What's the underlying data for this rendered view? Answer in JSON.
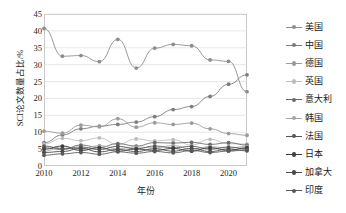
{
  "chart_data": {
    "type": "line",
    "title": "",
    "xlabel": "年份",
    "ylabel": "SCI论文数量占比/%",
    "x": [
      2010,
      2011,
      2012,
      2013,
      2014,
      2015,
      2016,
      2017,
      2018,
      2019,
      2020,
      2021
    ],
    "xticks": [
      "2010",
      "2012",
      "2014",
      "2016",
      "2018",
      "2020"
    ],
    "yticks": [
      "0",
      "5",
      "10",
      "15",
      "20",
      "25",
      "30",
      "35",
      "40",
      "45"
    ],
    "ylim": [
      0,
      45
    ],
    "xlim": [
      2010,
      2021
    ],
    "grid": "horizontal",
    "legend_position": "right",
    "series": [
      {
        "name": "美国",
        "color": "#8d8d8d",
        "values": [
          40.7,
          32.5,
          32.7,
          30.9,
          37.5,
          29.0,
          34.9,
          36.0,
          35.6,
          31.4,
          31.0,
          22.0
        ]
      },
      {
        "name": "中国",
        "color": "#7d7d7d",
        "values": [
          6.9,
          9.2,
          11.0,
          11.8,
          12.3,
          13.0,
          14.6,
          16.7,
          17.6,
          20.6,
          24.2,
          27.0
        ]
      },
      {
        "name": "德国",
        "color": "#9b9b9b",
        "values": [
          10.3,
          9.7,
          12.1,
          11.6,
          14.0,
          11.5,
          12.8,
          12.3,
          12.7,
          11.0,
          9.6,
          9.1
        ]
      },
      {
        "name": "英国",
        "color": "#bdbdbd",
        "values": [
          6.5,
          8.2,
          7.5,
          8.3,
          6.4,
          8.0,
          7.4,
          7.8,
          6.2,
          7.9,
          6.6,
          6.5
        ]
      },
      {
        "name": "意大利",
        "color": "#6a6a6a",
        "values": [
          5.4,
          4.9,
          6.2,
          5.5,
          6.6,
          5.9,
          6.9,
          6.8,
          7.0,
          6.4,
          6.9,
          6.2
        ]
      },
      {
        "name": "韩国",
        "color": "#a6a6a6",
        "values": [
          4.4,
          5.7,
          5.0,
          6.0,
          5.2,
          5.6,
          5.4,
          6.0,
          5.0,
          5.7,
          5.3,
          5.8
        ]
      },
      {
        "name": "法国",
        "color": "#555555",
        "values": [
          5.9,
          5.1,
          5.6,
          4.9,
          5.8,
          5.1,
          5.9,
          5.4,
          5.8,
          5.0,
          5.6,
          5.1
        ]
      },
      {
        "name": "日本",
        "color": "#3f3f3f",
        "values": [
          5.0,
          5.9,
          4.6,
          5.4,
          4.4,
          5.0,
          4.6,
          5.2,
          4.4,
          5.4,
          4.6,
          5.4
        ]
      },
      {
        "name": "加拿大",
        "color": "#4a4a4a",
        "values": [
          4.0,
          4.3,
          5.2,
          4.2,
          4.9,
          4.3,
          5.1,
          4.4,
          5.2,
          4.3,
          5.0,
          4.5
        ]
      },
      {
        "name": "印度",
        "color": "#595959",
        "values": [
          3.2,
          3.6,
          4.0,
          3.5,
          4.2,
          3.8,
          4.3,
          3.9,
          4.6,
          4.0,
          4.4,
          4.8
        ]
      }
    ]
  }
}
